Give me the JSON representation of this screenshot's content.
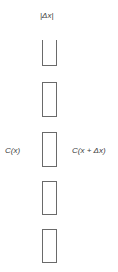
{
  "diagram": {
    "top_label": "|Δx|",
    "left_label": "C(x)",
    "right_label": "C(x + Δx)",
    "elements": [
      {
        "type": "open-top-box",
        "top": 40,
        "height": 25
      },
      {
        "type": "box",
        "top": 82,
        "height": 33
      },
      {
        "type": "box",
        "top": 132,
        "height": 33
      },
      {
        "type": "box",
        "top": 181,
        "height": 32
      },
      {
        "type": "box",
        "top": 229,
        "height": 32
      }
    ],
    "stroke_color": "#6a6a6a",
    "background": "#ffffff"
  }
}
